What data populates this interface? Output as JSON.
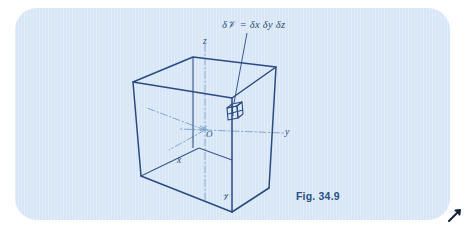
{
  "figure": {
    "caption": "Fig. 34.9",
    "panel_color": "#d7e6f6",
    "ink_color": "#2a4a80",
    "page_background": "#ffffff"
  },
  "labels": {
    "volume_equation": "δ𝒱 = δx δy δz",
    "axis_z": "z",
    "axis_y": "y",
    "axis_x": "x",
    "origin": "O",
    "volume_region": "𝒱"
  },
  "icons": {
    "cursor": "arrow-cursor-icon"
  },
  "diagram_data": {
    "type": "3d-line-diagram",
    "description": "Wireframe cube representing a volume V in 3D Cartesian space with origin O, axes x, y, z drawn as dash-dot lines, and a small cubical volume element of size delta-x by delta-y by delta-z inside it.",
    "cube_vertices": {
      "back_top_left": [
        193,
        57
      ],
      "back_top_right": [
        276,
        67
      ],
      "front_top_left": [
        133,
        82
      ],
      "front_top_right": [
        232,
        98
      ],
      "front_bottom_left": [
        141,
        176
      ],
      "front_bottom_right": [
        232,
        212
      ],
      "back_bottom_right": [
        269,
        188
      ],
      "back_bottom_left": [
        199,
        148
      ]
    },
    "origin_point": [
      205,
      130
    ],
    "volume_element": {
      "center": [
        233,
        111
      ],
      "size_px": 15,
      "label": "δ𝒱 = δx δy δz"
    },
    "axes": [
      {
        "name": "z",
        "style": "dash-dot",
        "from": [
          205,
          198
        ],
        "to": [
          205,
          44
        ]
      },
      {
        "name": "y",
        "style": "dash-dot",
        "from": [
          205,
          130
        ],
        "to": [
          283,
          133
        ]
      },
      {
        "name": "x",
        "style": "dash-dot",
        "from": [
          205,
          130
        ],
        "to": [
          168,
          150
        ]
      },
      {
        "name": "x-negative",
        "style": "dash-dot",
        "from": [
          205,
          130
        ],
        "to": [
          148,
          108
        ]
      }
    ],
    "leader_line": {
      "from": [
        247,
        34
      ],
      "to": [
        233,
        104
      ]
    }
  }
}
